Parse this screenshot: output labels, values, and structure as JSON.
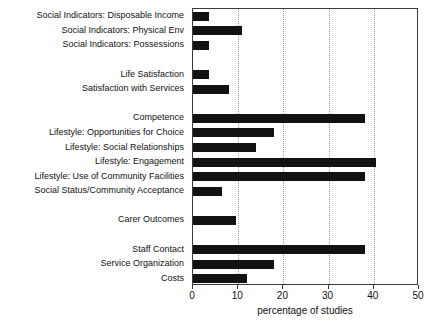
{
  "chart_data": {
    "type": "bar",
    "orientation": "horizontal",
    "title": "",
    "xlabel": "percentage of studies",
    "ylabel": "",
    "xlim": [
      0,
      50
    ],
    "xticks": [
      0,
      10,
      20,
      30,
      40,
      50
    ],
    "xtick_labels": [
      "0",
      "10",
      "20",
      "30",
      "40",
      "50"
    ],
    "grid": "vertical-dotted",
    "legend": "none",
    "bar_color": "#121212",
    "categories": [
      "Social Indicators: Disposable Income",
      "Social Indicators: Physical Env",
      "Social Indicators: Possessions",
      "Life Satisfaction",
      "Satisfaction with Services",
      "Competence",
      "Lifestyle: Opportunities for Choice",
      "Lifestyle: Social Relationships",
      "Lifestyle: Engagement",
      "Lifestyle: Use of Community Facilities",
      "Social Status/Community Acceptance",
      "Carer Outcomes",
      "Staff Contact",
      "Service Organization",
      "Costs"
    ],
    "values": [
      3.5,
      10.8,
      3.5,
      3.5,
      8,
      38,
      18,
      14,
      40.5,
      38,
      6.5,
      9.5,
      38,
      18,
      12
    ],
    "groups": [
      {
        "name": "",
        "categories": [
          "Social Indicators: Disposable Income",
          "Social Indicators: Physical Env",
          "Social Indicators: Possessions"
        ]
      },
      {
        "name": "",
        "categories": [
          "Life Satisfaction",
          "Satisfaction with Services"
        ]
      },
      {
        "name": "",
        "categories": [
          "Competence",
          "Lifestyle: Opportunities for Choice",
          "Lifestyle: Social Relationships",
          "Lifestyle: Engagement",
          "Lifestyle: Use of Community Facilities",
          "Social Status/Community Acceptance"
        ]
      },
      {
        "name": "",
        "categories": [
          "Carer Outcomes"
        ]
      },
      {
        "name": "",
        "categories": [
          "Staff Contact",
          "Service Organization",
          "Costs"
        ]
      }
    ]
  }
}
